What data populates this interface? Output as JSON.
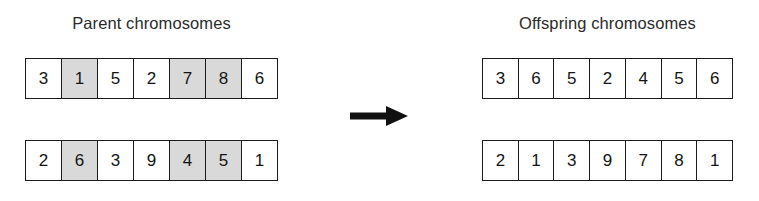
{
  "labels": {
    "parent_title": "Parent chromosomes",
    "offspring_title": "Offspring chromosomes"
  },
  "colors": {
    "background": "#ffffff",
    "cell_fill": "#ffffff",
    "cell_shaded_fill": "#d9d9d9",
    "border": "#1c1c1c",
    "text": "#141414",
    "arrow": "#111111"
  },
  "chart_data": {
    "type": "diagram",
    "operation": "crossover",
    "gene_count": 7,
    "shaded_positions": [
      2,
      5,
      6
    ],
    "groups": [
      {
        "name": "parent",
        "title": "Parent chromosomes",
        "chromosomes": [
          {
            "name": "parent-1",
            "genes": [
              "3",
              "1",
              "5",
              "2",
              "7",
              "8",
              "6"
            ],
            "shaded": [
              false,
              true,
              false,
              false,
              true,
              true,
              false
            ]
          },
          {
            "name": "parent-2",
            "genes": [
              "2",
              "6",
              "3",
              "9",
              "4",
              "5",
              "1"
            ],
            "shaded": [
              false,
              true,
              false,
              false,
              true,
              true,
              false
            ]
          }
        ]
      },
      {
        "name": "offspring",
        "title": "Offspring chromosomes",
        "chromosomes": [
          {
            "name": "offspring-1",
            "genes": [
              "3",
              "6",
              "5",
              "2",
              "4",
              "5",
              "6"
            ],
            "shaded": [
              false,
              false,
              false,
              false,
              false,
              false,
              false
            ]
          },
          {
            "name": "offspring-2",
            "genes": [
              "2",
              "1",
              "3",
              "9",
              "7",
              "8",
              "1"
            ],
            "shaded": [
              false,
              false,
              false,
              false,
              false,
              false,
              false
            ]
          }
        ]
      }
    ],
    "connector": {
      "name": "crossover-arrow",
      "direction": "right"
    }
  }
}
